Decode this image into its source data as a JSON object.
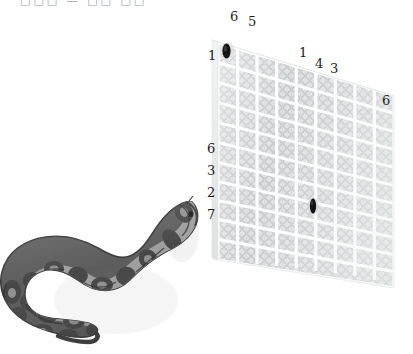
{
  "scene": {
    "title_strip": "□□□ — □□ □□",
    "background_color": "#ffffff",
    "description": "Grayscale illustration: coiled python snake at lower-left, perspective mesh grid panel at right with scattered numeric annotations"
  },
  "annotations": {
    "top_left_label": "6",
    "top_second_label": "5",
    "left_edge_label": "1",
    "top_right_first": "1",
    "top_right_second": "4",
    "top_right_third": "3",
    "far_right_label": "6",
    "side_column": [
      "6",
      "3",
      "2",
      "7"
    ]
  },
  "panel": {
    "name": "mesh-grid-panel",
    "columns": 9,
    "rows": 11,
    "frame_color": "#e9eaea",
    "mesh_color": "#c9cccd",
    "grout_color": "#fdfdfd",
    "markers": [
      {
        "id": "marker-top-left",
        "label": "dark-oval-marker",
        "color": "#1a1a1a"
      },
      {
        "id": "marker-center",
        "label": "dark-oval-marker",
        "color": "#1a1a1a"
      }
    ]
  },
  "snake": {
    "name": "python-snake",
    "body_dark": "#4a4a4a",
    "body_mid": "#6e6e6e",
    "body_light": "#9b9b9b",
    "outline": "#3a3a3a",
    "shadow": "#e4e4e4"
  }
}
